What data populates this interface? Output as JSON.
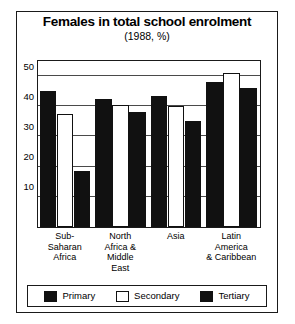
{
  "chart_data": {
    "type": "bar",
    "title": "Females in total school enrolment",
    "subtitle": "(1988, %)",
    "xlabel": "",
    "ylabel": "",
    "ylim": [
      0,
      55
    ],
    "yticks": [
      10,
      20,
      30,
      40,
      50
    ],
    "grid": true,
    "legend_position": "bottom",
    "categories": [
      "Sub-\nSaharan\nAfrica",
      "North\nAfrica &\nMiddle\nEast",
      "Asia",
      "Latin\nAmerica\n& Caribbean"
    ],
    "category_lines": [
      [
        "Sub-",
        "Saharan",
        "Africa"
      ],
      [
        "North",
        "Africa &",
        "Middle",
        "East"
      ],
      [
        "Asia"
      ],
      [
        "Latin",
        "America",
        "& Caribbean"
      ]
    ],
    "series": [
      {
        "name": "Primary",
        "color": "#111111",
        "fill": "dark",
        "values": [
          45,
          42.5,
          43.5,
          48
        ]
      },
      {
        "name": "Secondary",
        "color": "#ffffff",
        "fill": "light",
        "values": [
          37.5,
          40.5,
          40,
          51
        ]
      },
      {
        "name": "Tertiary",
        "color": "#111111",
        "fill": "dark",
        "values": [
          18.5,
          38,
          35,
          46
        ]
      }
    ]
  },
  "legend": {
    "items": [
      {
        "label": "Primary",
        "fill": "dark"
      },
      {
        "label": "Secondary",
        "fill": "light"
      },
      {
        "label": "Tertiary",
        "fill": "dark"
      }
    ]
  }
}
